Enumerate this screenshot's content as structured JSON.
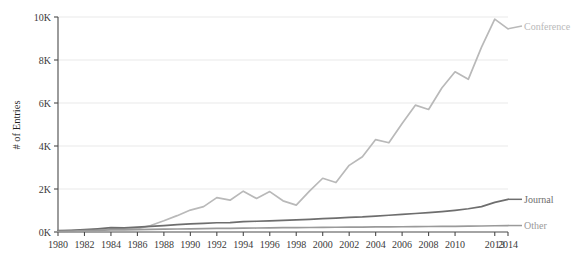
{
  "chart_data": {
    "type": "line",
    "title": "",
    "xlabel": "",
    "ylabel": "# of Entries",
    "xlim": [
      1980,
      2014
    ],
    "ylim": [
      0,
      10000
    ],
    "grid": true,
    "legend_position": "right-inline",
    "x": [
      1980,
      1981,
      1982,
      1983,
      1984,
      1985,
      1986,
      1987,
      1988,
      1989,
      1990,
      1991,
      1992,
      1993,
      1994,
      1995,
      1996,
      1997,
      1998,
      1999,
      2000,
      2001,
      2002,
      2003,
      2004,
      2005,
      2006,
      2007,
      2008,
      2009,
      2010,
      2011,
      2012,
      2013,
      2014
    ],
    "xtick_labels": [
      "1980",
      "",
      "1982",
      "",
      "1984",
      "",
      "1986",
      "",
      "1988",
      "",
      "1990",
      "",
      "1992",
      "",
      "1994",
      "",
      "1996",
      "",
      "1998",
      "",
      "2000",
      "",
      "2002",
      "",
      "2004",
      "",
      "2006",
      "",
      "2008",
      "",
      "2010",
      "",
      "",
      "2013",
      "2014"
    ],
    "ytick_labels": [
      "0K",
      "2K",
      "4K",
      "6K",
      "8K",
      "10K"
    ],
    "ytick_values": [
      0,
      2000,
      4000,
      6000,
      8000,
      10000
    ],
    "series": [
      {
        "name": "Conference",
        "color": "#b9b9b9",
        "label": "Conference",
        "values": [
          40,
          60,
          90,
          110,
          140,
          130,
          160,
          300,
          520,
          760,
          1020,
          1180,
          1600,
          1480,
          1900,
          1560,
          1880,
          1450,
          1250,
          1900,
          2500,
          2300,
          3100,
          3500,
          4300,
          4150,
          5050,
          5900,
          5700,
          6700,
          7450,
          7100,
          8600,
          9900,
          9450
        ]
      },
      {
        "name": "Journal",
        "color": "#6e6e6e",
        "label": "Journal",
        "values": [
          60,
          80,
          110,
          150,
          200,
          190,
          230,
          260,
          300,
          340,
          380,
          400,
          430,
          440,
          480,
          500,
          520,
          540,
          560,
          590,
          620,
          650,
          680,
          700,
          740,
          780,
          820,
          860,
          900,
          950,
          1010,
          1080,
          1180,
          1380,
          1520
        ]
      },
      {
        "name": "Other",
        "color": "#9a9a9a",
        "label": "Other",
        "values": [
          30,
          45,
          60,
          80,
          100,
          95,
          110,
          120,
          130,
          140,
          150,
          155,
          165,
          170,
          180,
          185,
          195,
          200,
          205,
          210,
          215,
          220,
          225,
          230,
          235,
          240,
          245,
          250,
          255,
          260,
          265,
          272,
          280,
          290,
          300
        ]
      }
    ],
    "axis_color": "#4a4a4a",
    "grid_color": "#e3e3e3"
  }
}
